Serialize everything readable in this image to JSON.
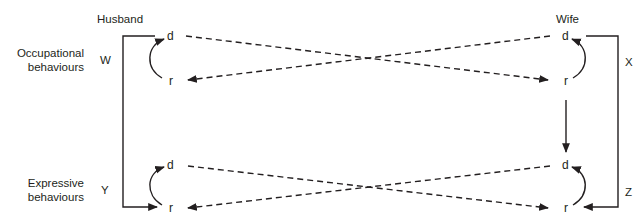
{
  "diagram": {
    "columns": {
      "husband": "Husband",
      "wife": "Wife"
    },
    "rows": {
      "occupational": [
        "Occupational",
        "behaviours"
      ],
      "expressive": [
        "Expressive",
        "behaviours"
      ]
    },
    "path_labels": {
      "w": "W",
      "x": "X",
      "y": "Y",
      "z": "Z"
    },
    "nodes": {
      "husband_occ_d": "d",
      "husband_occ_r": "r",
      "husband_exp_d": "d",
      "husband_exp_r": "r",
      "wife_occ_d": "d",
      "wife_occ_r": "r",
      "wife_exp_d": "d",
      "wife_exp_r": "r"
    },
    "edges": [
      {
        "from": "husband_occ_d",
        "to": "wife_occ_r",
        "style": "dashed"
      },
      {
        "from": "wife_occ_d",
        "to": "husband_occ_r",
        "style": "dashed"
      },
      {
        "from": "husband_exp_d",
        "to": "wife_exp_r",
        "style": "dashed"
      },
      {
        "from": "wife_exp_d",
        "to": "husband_exp_r",
        "style": "dashed"
      },
      {
        "from": "husband_occ_r",
        "to": "husband_occ_d",
        "style": "curved"
      },
      {
        "from": "husband_exp_r",
        "to": "husband_exp_d",
        "style": "curved"
      },
      {
        "from": "wife_occ_r",
        "to": "wife_occ_d",
        "style": "curved"
      },
      {
        "from": "wife_exp_r",
        "to": "wife_exp_d",
        "style": "curved"
      },
      {
        "from": "husband_occ_d",
        "to": "husband_exp_r",
        "label": "W/Y",
        "style": "solid-bracket"
      },
      {
        "from": "wife_occ_d",
        "to": "wife_exp_r",
        "label": "X/Z",
        "style": "solid-bracket"
      },
      {
        "from": "wife_occ_r",
        "to": "wife_exp_d",
        "style": "solid"
      }
    ],
    "line_color": "#231f20"
  }
}
